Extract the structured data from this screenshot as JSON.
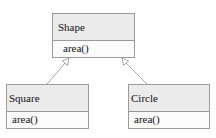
{
  "diagram": {
    "type": "uml-class-diagram",
    "classes": [
      {
        "id": "shape",
        "name": "Shape",
        "methods": [
          "area()"
        ]
      },
      {
        "id": "square",
        "name": "Square",
        "methods": [
          "area()"
        ]
      },
      {
        "id": "circle",
        "name": "Circle",
        "methods": [
          "area()"
        ]
      }
    ],
    "relations": [
      {
        "from": "Square",
        "to": "Shape",
        "type": "generalization"
      },
      {
        "from": "Circle",
        "to": "Shape",
        "type": "generalization"
      }
    ]
  },
  "colors": {
    "header_fill": "#ebebeb",
    "body_fill": "#fbfbfb",
    "border": "#9a9a9a",
    "arrow": "#9a9a9a"
  }
}
